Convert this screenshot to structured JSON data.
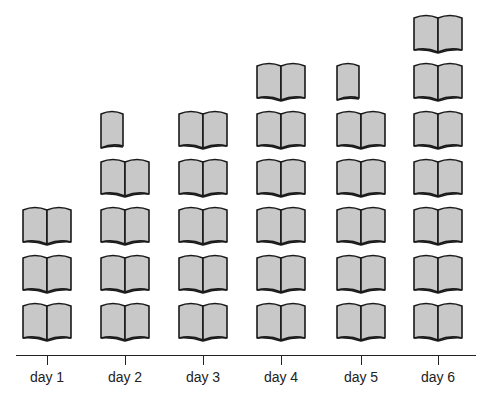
{
  "chart_data": {
    "type": "pictograph",
    "title": "",
    "xlabel": "",
    "ylabel": "",
    "icon": "open-book-icon",
    "categories": [
      "day 1",
      "day 2",
      "day 3",
      "day 4",
      "day 5",
      "day 6"
    ],
    "values": [
      3,
      4.5,
      5,
      6,
      5.5,
      7
    ],
    "legend": [],
    "grid": false,
    "colors": {
      "fill": "#c8c8c8",
      "stroke": "#1a1a1a",
      "axis": "#222222"
    }
  },
  "axis": {
    "labels": [
      "day 1",
      "day 2",
      "day 3",
      "day 4",
      "day 5",
      "day 6"
    ]
  }
}
